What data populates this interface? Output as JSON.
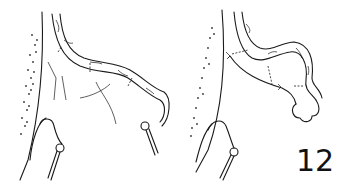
{
  "figure": {
    "number": "12",
    "panels": [
      {
        "id": "left",
        "description": "surgical illustration: tubular structure with ligatures, retracted by hook"
      },
      {
        "id": "right",
        "description": "surgical illustration: tubular structure divided and ligated, retracted by hook"
      }
    ],
    "icons": [
      "retractor-hook-icon",
      "ligature-icon"
    ],
    "colors": {
      "ink": "#1a1a1a",
      "background": "#ffffff"
    }
  }
}
